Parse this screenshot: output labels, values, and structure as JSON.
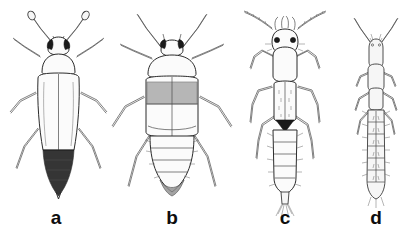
{
  "figure": {
    "kind": "scientific-illustration-plate",
    "background_color": "#ffffff",
    "ink_color": "#2b2b2b",
    "label_color": "#0d0d0d",
    "panel_count": 4,
    "panels": [
      {
        "id": "a",
        "label": "a",
        "description": "Dorsal view of a small oval beetle-like insect with broad pale elytra, rounded pronotum, dark eyes, clubbed antennae and a dark banded triangular abdomen tip extending beyond the elytra.",
        "body_form": "oval-beetle",
        "shading": "pale body with dark posterior abdominal bands",
        "antennae": "clubbed",
        "leg_pairs": 3
      },
      {
        "id": "b",
        "label": "b",
        "description": "Dorsal view of a broad-bodied insect with large pale pronotum, a dark transverse band across the folded wings, and a tapering segmented abdomen with a dark tip.",
        "body_form": "broad-oval",
        "shading": "pale with dark transverse wing band",
        "antennae": "slender, angled forward",
        "leg_pairs": 3
      },
      {
        "id": "c",
        "label": "c",
        "description": "Dorsal view of an elongate insect with long curved segmented antennae, projecting mouthparts, narrow wing pads with dark triangular marks, and a long segmented abdomen fringed with bristles.",
        "body_form": "elongate-slender",
        "shading": "pale with dark triangular thoracic marks",
        "antennae": "long, curved, segmented",
        "leg_pairs": 3
      },
      {
        "id": "d",
        "label": "d",
        "description": "Dorsal view of a slender pale larva with simple V-shaped antennae, narrow thorax and a long segmented abdomen bearing fine lateral bristles.",
        "body_form": "slender-larva",
        "shading": "uniformly pale, fine outline only",
        "antennae": "short, V-shaped",
        "leg_pairs": 3
      }
    ]
  },
  "labels": {
    "a": "a",
    "b": "b",
    "c": "c",
    "d": "d"
  }
}
